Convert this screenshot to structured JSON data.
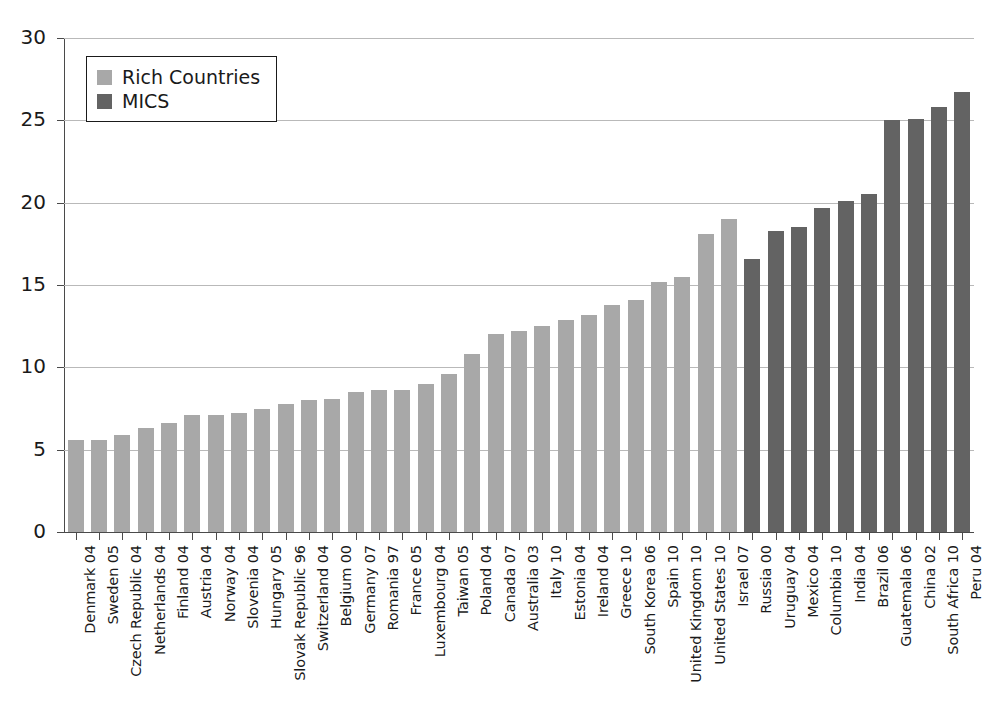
{
  "chart_data": {
    "type": "bar",
    "title": "",
    "subtitle": "",
    "xlabel": "",
    "ylabel": "",
    "ylim": [
      0,
      30
    ],
    "yticks": [
      0,
      5,
      10,
      15,
      20,
      25,
      30
    ],
    "grid": true,
    "legend_position": "top-left",
    "colors": {
      "rich_countries": "#a8a8a8",
      "mics": "#636363",
      "axis": "#4a4a4a",
      "gridline": "#b9b9b9",
      "background": "#ffffff"
    },
    "legend": [
      {
        "label": "Rich Countries",
        "color": "#a8a8a8",
        "key": "rich"
      },
      {
        "label": "MICS",
        "color": "#636363",
        "key": "mics"
      }
    ],
    "categories": [
      "Denmark 04",
      "Sweden 05",
      "Czech Republic 04",
      "Netherlands 04",
      "Finland 04",
      "Austria 04",
      "Norway 04",
      "Slovenia 04",
      "Hungary 05",
      "Slovak Republic 96",
      "Switzerland 04",
      "Belgium 00",
      "Germany 07",
      "Romania 97",
      "France 05",
      "Luxembourg 04",
      "Taiwan 05",
      "Poland 04",
      "Canada 07",
      "Australia 03",
      "Italy 10",
      "Estonia 04",
      "Ireland 04",
      "Greece 10",
      "South Korea 06",
      "Spain 10",
      "United Kingdom 10",
      "United States 10",
      "Israel 07",
      "Russia 00",
      "Uruguay 04",
      "Mexico 04",
      "Columbia 10",
      "India 04",
      "Brazil 06",
      "Guatemala 06",
      "China 02",
      "South Africa 10",
      "Peru 04"
    ],
    "values": [
      5.6,
      5.6,
      5.9,
      6.3,
      6.6,
      7.1,
      7.1,
      7.2,
      7.5,
      7.8,
      8.0,
      8.1,
      8.5,
      8.6,
      8.6,
      9.0,
      9.6,
      10.8,
      12.0,
      12.2,
      12.5,
      12.9,
      13.2,
      13.8,
      14.1,
      15.2,
      15.5,
      18.1,
      19.0,
      16.6,
      18.3,
      18.5,
      19.7,
      20.1,
      20.5,
      25.0,
      25.1,
      25.8,
      26.7
    ],
    "groups": [
      "rich",
      "rich",
      "rich",
      "rich",
      "rich",
      "rich",
      "rich",
      "rich",
      "rich",
      "rich",
      "rich",
      "rich",
      "rich",
      "rich",
      "rich",
      "rich",
      "rich",
      "rich",
      "rich",
      "rich",
      "rich",
      "rich",
      "rich",
      "rich",
      "rich",
      "rich",
      "rich",
      "rich",
      "rich",
      "mics",
      "mics",
      "mics",
      "mics",
      "mics",
      "mics",
      "mics",
      "mics",
      "mics",
      "mics"
    ]
  }
}
